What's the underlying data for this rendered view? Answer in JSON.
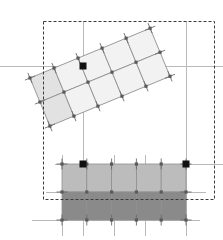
{
  "app": {
    "title": "Mesh Deform Canvas",
    "canvas": {
      "width": 223,
      "height": 240,
      "background": "#ffffff"
    }
  },
  "colors": {
    "background": "#ffffff",
    "guide_line": "#b9b9b9",
    "selection_dash": "#3a3a3a",
    "mesh_line": "#8f8f8f",
    "mesh_line_dark": "#6e6e6e",
    "vertex": "#5a5a5a",
    "handle": "#111111",
    "fill_light": "#f2f2f2",
    "fill_light_edge": "#e2e2e2",
    "fill_mid": "#bcbcbc",
    "fill_dark": "#8a8a8a",
    "tick": "#6a6a6a"
  },
  "selection_box": {
    "name": "dashed-selection-bounds",
    "x": 43,
    "y": 21,
    "width": 171,
    "height": 178,
    "stroke": "#3a3a3a",
    "dash": "3,2",
    "stroke_width": 1
  },
  "guides": {
    "horizontal": [
      {
        "y": 66,
        "x1": 0,
        "x2": 223
      },
      {
        "y": 164,
        "x1": 55,
        "x2": 223
      },
      {
        "y": 192,
        "x1": 46,
        "x2": 206
      },
      {
        "y": 220,
        "x1": 32,
        "x2": 200
      }
    ],
    "vertical": [
      {
        "x": 83,
        "y1": 21,
        "y2": 236
      },
      {
        "x": 186,
        "y1": 21,
        "y2": 236
      },
      {
        "x": 62,
        "y1": 155,
        "y2": 236
      },
      {
        "x": 114,
        "y1": 155,
        "y2": 236
      },
      {
        "x": 145,
        "y1": 155,
        "y2": 236
      }
    ]
  },
  "rotated_mesh": {
    "name": "rotated-quad-mesh",
    "rotation_deg": -22.5,
    "columns": 5,
    "rows": 2,
    "origin": {
      "x": 30,
      "y": 78
    },
    "cell_width": 26,
    "cell_height": 26,
    "fill_body": "#f2f2f2",
    "fill_first_column": "#e2e2e2",
    "stroke": "#8f8f8f",
    "vertex_size": 3.2,
    "handles": [
      {
        "x": 83,
        "y": 66,
        "size": 7
      }
    ],
    "corner_ticks": 4
  },
  "lower_mesh": {
    "name": "lower-rect-mesh",
    "columns": 5,
    "rows": 2,
    "x": 62,
    "y": 164,
    "width": 124,
    "height": 56,
    "row_fills": [
      "#bcbcbc",
      "#8a8a8a"
    ],
    "stroke": "#8f8f8f",
    "vertex_size": 3.2,
    "handles": [
      {
        "x": 83,
        "y": 164,
        "size": 7
      },
      {
        "x": 186,
        "y": 164,
        "size": 7
      }
    ]
  },
  "vertex_ticks": {
    "name": "vertex-whisker-ticks",
    "length": 11,
    "stroke": "#6a6a6a"
  }
}
